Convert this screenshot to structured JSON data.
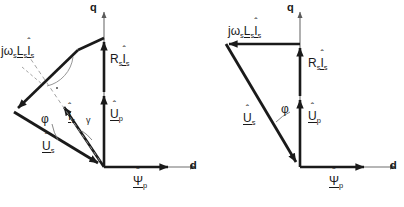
{
  "figure": {
    "type": "vector-phasor-diagram-pair",
    "stroke_color": "#1a1a1a",
    "thin_stroke_color": "#6e6e6e",
    "background": "#ffffff"
  },
  "left_diagram": {
    "name": "phasor-diagram-with-current-angle",
    "axes": {
      "q_label": "q",
      "d_label": "d"
    },
    "vectors": [
      {
        "key": "jwLsIs",
        "base": "jω",
        "sub1": "s",
        "mid": "L",
        "sub2": "s",
        "cur": "I",
        "sub3": "s",
        "label_plain": "jωsLsÎs"
      },
      {
        "key": "RsIs",
        "base": "R",
        "sub1": "s",
        "cur": "I",
        "sub2": "s",
        "label_plain": "RsÎs"
      },
      {
        "key": "Up",
        "base": "U",
        "sub1": "p",
        "label_plain": "Ûp"
      },
      {
        "key": "Us",
        "base": "U",
        "sub1": "s",
        "label_plain": "Ûs"
      },
      {
        "key": "Is",
        "base": "I",
        "sub1": "s",
        "label_plain": "Îs"
      },
      {
        "key": "Psip",
        "base": "Ψ",
        "sub1": "p",
        "label_plain": "Ψ̂p"
      }
    ],
    "angles": [
      {
        "key": "phi",
        "symbol": "φ"
      },
      {
        "key": "gamma",
        "symbol": "γ"
      },
      {
        "key": "right-angle",
        "symbol": "·"
      }
    ]
  },
  "right_diagram": {
    "name": "phasor-diagram-simplified",
    "axes": {
      "q_label": "q",
      "d_label": "d"
    },
    "vectors": [
      {
        "key": "jwLsIs",
        "base": "jω",
        "sub1": "s",
        "mid": "L",
        "sub2": "s",
        "cur": "I",
        "sub3": "s",
        "label_plain": "jωsLsÎs"
      },
      {
        "key": "RsIs",
        "base": "R",
        "sub1": "s",
        "cur": "I",
        "sub2": "s",
        "label_plain": "RsÎs"
      },
      {
        "key": "Up",
        "base": "U",
        "sub1": "p",
        "label_plain": "Ûp"
      },
      {
        "key": "Us",
        "base": "U",
        "sub1": "s",
        "label_plain": "Ûs"
      },
      {
        "key": "Psip",
        "base": "Ψ",
        "sub1": "p",
        "label_plain": "Ψ̂p"
      }
    ],
    "angles": [
      {
        "key": "phi",
        "symbol": "φ"
      }
    ]
  },
  "glyphs": {
    "hat": "ˆ",
    "j": "j",
    "omega": "ω",
    "L": "L",
    "R": "R",
    "U": "U",
    "I": "I",
    "Psi": "Ψ",
    "phi": "φ",
    "gamma": "γ",
    "dot": "·",
    "q": "q",
    "d": "d",
    "s": "s",
    "p": "p"
  },
  "footer_text": ""
}
